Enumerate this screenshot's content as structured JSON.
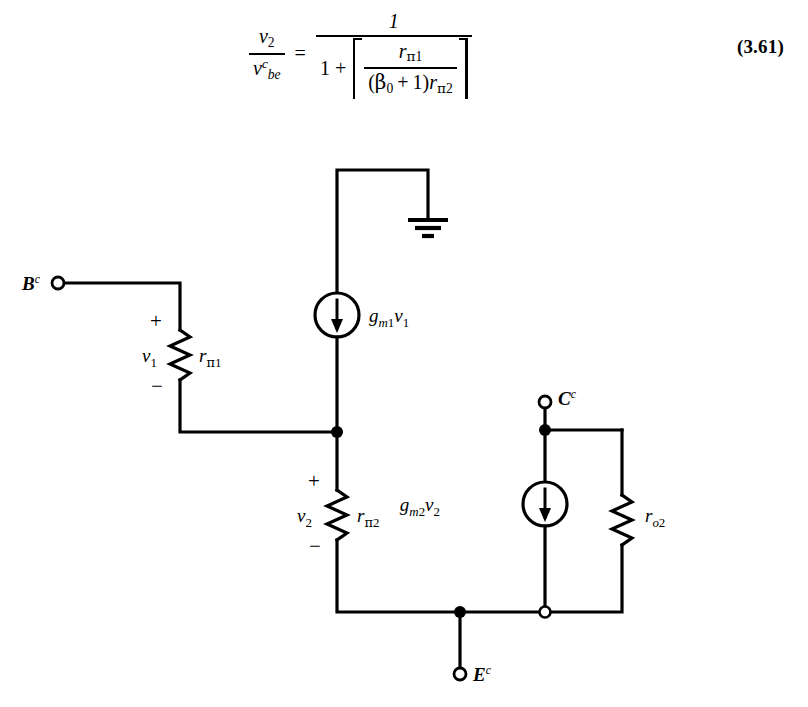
{
  "equation": {
    "number": "(3.61)",
    "lhs": {
      "numerator": "v",
      "numerator_sub": "2",
      "denominator": "v",
      "denominator_sub": "be",
      "denominator_sup": "c"
    },
    "equals": "=",
    "rhs": {
      "numerator": "1",
      "denominator_lead": "1",
      "denominator_plus": "+",
      "inner_numerator": "r",
      "inner_numerator_sub_greek": "π",
      "inner_numerator_sub_index": "1",
      "inner_denominator_open": "(",
      "inner_denominator_beta": "β",
      "inner_denominator_beta_sub": "0",
      "inner_denominator_plus": "+",
      "inner_denominator_one": "1",
      "inner_denominator_close": ")",
      "inner_denominator_r": "r",
      "inner_denominator_r_sub_greek": "π",
      "inner_denominator_r_sub_index": "2"
    }
  },
  "circuit": {
    "title": "Small-signal hybrid-pi equivalent circuit",
    "terminals": [
      {
        "id": "base",
        "label_base": "B",
        "label_sup": "c"
      },
      {
        "id": "collector",
        "label_base": "C",
        "label_sup": "c"
      },
      {
        "id": "emitter",
        "label_base": "E",
        "label_sup": "c"
      }
    ],
    "components": {
      "resistor_rpi1": {
        "label_base": "r",
        "label_sub_greek": "π",
        "label_sub_index": "1"
      },
      "resistor_rpi2": {
        "label_base": "r",
        "label_sub_greek": "π",
        "label_sub_index": "2"
      },
      "resistor_ro2": {
        "label_base": "r",
        "label_sub_italic": "o",
        "label_sub_index": "2"
      },
      "source_gm1v1": {
        "g": "g",
        "g_sub": "m",
        "g_sub_index": "1",
        "v": "v",
        "v_sub": "1",
        "arrow_direction": "down"
      },
      "source_gm2v2": {
        "g": "g",
        "g_sub": "m",
        "g_sub_index": "2",
        "v": "v",
        "v_sub": "2",
        "arrow_direction": "down"
      }
    },
    "node_voltages": [
      {
        "id": "v1",
        "label_base": "v",
        "label_sub": "1",
        "plus": "+",
        "minus": "−"
      },
      {
        "id": "v2",
        "label_base": "v",
        "label_sub": "2",
        "plus": "+",
        "minus": "−"
      }
    ],
    "ground": {
      "name": "ground-symbol"
    },
    "colors": {
      "line": "#000000",
      "background": "#ffffff"
    }
  }
}
